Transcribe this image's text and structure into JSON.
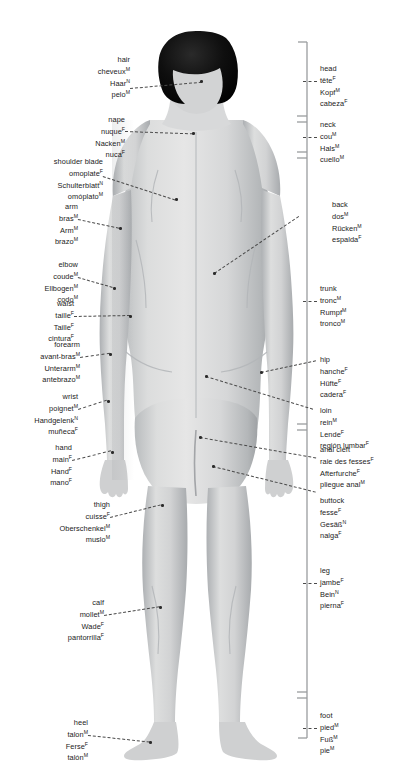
{
  "canvas": {
    "width": 398,
    "height": 778,
    "background": "#ffffff"
  },
  "figure": {
    "skin_color": "#d9dadb",
    "shadow_color": "#a9abad",
    "hair_color": "#0d0d0d",
    "outline_color": "#8d9093"
  },
  "left_labels": [
    {
      "name": "hair",
      "lines": [
        {
          "text": "hair",
          "gender": ""
        },
        {
          "text": "cheveux",
          "gender": "M"
        },
        {
          "text": "Haar",
          "gender": "N"
        },
        {
          "text": "pelo",
          "gender": "M"
        }
      ]
    },
    {
      "name": "nape",
      "lines": [
        {
          "text": "nape",
          "gender": ""
        },
        {
          "text": "nuque",
          "gender": "F"
        },
        {
          "text": "Nacken",
          "gender": "M"
        },
        {
          "text": "nuca",
          "gender": "F"
        }
      ]
    },
    {
      "name": "shoulder-blade",
      "lines": [
        {
          "text": "shoulder blade",
          "gender": ""
        },
        {
          "text": "omoplate",
          "gender": "F"
        },
        {
          "text": "Schulterblatt",
          "gender": "N"
        },
        {
          "text": "omóplato",
          "gender": "M"
        }
      ]
    },
    {
      "name": "arm",
      "lines": [
        {
          "text": "arm",
          "gender": ""
        },
        {
          "text": "bras",
          "gender": "M"
        },
        {
          "text": "Arm",
          "gender": "M"
        },
        {
          "text": "brazo",
          "gender": "M"
        }
      ]
    },
    {
      "name": "elbow",
      "lines": [
        {
          "text": "elbow",
          "gender": ""
        },
        {
          "text": "coude",
          "gender": "M"
        },
        {
          "text": "Ellbogen",
          "gender": "M"
        },
        {
          "text": "codo",
          "gender": "M"
        }
      ]
    },
    {
      "name": "waist",
      "lines": [
        {
          "text": "waist",
          "gender": ""
        },
        {
          "text": "taille",
          "gender": "F"
        },
        {
          "text": "Taille",
          "gender": "F"
        },
        {
          "text": "cintura",
          "gender": "F"
        }
      ]
    },
    {
      "name": "forearm",
      "lines": [
        {
          "text": "forearm",
          "gender": ""
        },
        {
          "text": "avant-bras",
          "gender": "M"
        },
        {
          "text": "Unterarm",
          "gender": "M"
        },
        {
          "text": "antebrazo",
          "gender": "M"
        }
      ]
    },
    {
      "name": "wrist",
      "lines": [
        {
          "text": "wrist",
          "gender": ""
        },
        {
          "text": "poignet",
          "gender": "M"
        },
        {
          "text": "Handgelenk",
          "gender": "N"
        },
        {
          "text": "muñeca",
          "gender": "F"
        }
      ]
    },
    {
      "name": "hand",
      "lines": [
        {
          "text": "hand",
          "gender": ""
        },
        {
          "text": "main",
          "gender": "F"
        },
        {
          "text": "Hand",
          "gender": "F"
        },
        {
          "text": "mano",
          "gender": "F"
        }
      ]
    },
    {
      "name": "thigh",
      "lines": [
        {
          "text": "thigh",
          "gender": ""
        },
        {
          "text": "cuisse",
          "gender": "F"
        },
        {
          "text": "Oberschenkel",
          "gender": "M"
        },
        {
          "text": "muslo",
          "gender": "M"
        }
      ]
    },
    {
      "name": "calf",
      "lines": [
        {
          "text": "calf",
          "gender": ""
        },
        {
          "text": "mollet",
          "gender": "M"
        },
        {
          "text": "Wade",
          "gender": "F"
        },
        {
          "text": "pantorrilla",
          "gender": "F"
        }
      ]
    },
    {
      "name": "heel",
      "lines": [
        {
          "text": "heel",
          "gender": ""
        },
        {
          "text": "talon",
          "gender": "M"
        },
        {
          "text": "Ferse",
          "gender": "F"
        },
        {
          "text": "talón",
          "gender": "M"
        }
      ]
    }
  ],
  "right_labels": [
    {
      "name": "head",
      "lines": [
        {
          "text": "head",
          "gender": ""
        },
        {
          "text": "tête",
          "gender": "F"
        },
        {
          "text": "Kopf",
          "gender": "M"
        },
        {
          "text": "cabeza",
          "gender": "F"
        }
      ]
    },
    {
      "name": "neck",
      "lines": [
        {
          "text": "neck",
          "gender": ""
        },
        {
          "text": "cou",
          "gender": "M"
        },
        {
          "text": "Hals",
          "gender": "M"
        },
        {
          "text": "cuello",
          "gender": "M"
        }
      ]
    },
    {
      "name": "back",
      "lines": [
        {
          "text": "back",
          "gender": ""
        },
        {
          "text": "dos",
          "gender": "M"
        },
        {
          "text": "Rücken",
          "gender": "M"
        },
        {
          "text": "espalda",
          "gender": "F"
        }
      ]
    },
    {
      "name": "trunk",
      "lines": [
        {
          "text": "trunk",
          "gender": ""
        },
        {
          "text": "tronc",
          "gender": "M"
        },
        {
          "text": "Rumpf",
          "gender": "M"
        },
        {
          "text": "tronco",
          "gender": "M"
        }
      ]
    },
    {
      "name": "hip",
      "lines": [
        {
          "text": "hip",
          "gender": ""
        },
        {
          "text": "hanche",
          "gender": "F"
        },
        {
          "text": "Hüfte",
          "gender": "F"
        },
        {
          "text": "cadera",
          "gender": "F"
        }
      ]
    },
    {
      "name": "loin",
      "lines": [
        {
          "text": "loin",
          "gender": ""
        },
        {
          "text": "rein",
          "gender": "M"
        },
        {
          "text": "Lende",
          "gender": "F"
        },
        {
          "text": "región lumbar",
          "gender": "F"
        }
      ]
    },
    {
      "name": "anal-cleft",
      "lines": [
        {
          "text": "anal cleft",
          "gender": ""
        },
        {
          "text": "raie des fesses",
          "gender": "F"
        },
        {
          "text": "Afterfurche",
          "gender": "F"
        },
        {
          "text": "pliegue anal",
          "gender": "M"
        }
      ]
    },
    {
      "name": "buttock",
      "lines": [
        {
          "text": "buttock",
          "gender": ""
        },
        {
          "text": "fesse",
          "gender": "F"
        },
        {
          "text": "Gesäß",
          "gender": "N"
        },
        {
          "text": "nalga",
          "gender": "F"
        }
      ]
    },
    {
      "name": "leg",
      "lines": [
        {
          "text": "leg",
          "gender": ""
        },
        {
          "text": "jambe",
          "gender": "F"
        },
        {
          "text": "Bein",
          "gender": "N"
        },
        {
          "text": "pierna",
          "gender": "F"
        }
      ]
    },
    {
      "name": "foot",
      "lines": [
        {
          "text": "foot",
          "gender": ""
        },
        {
          "text": "pied",
          "gender": "M"
        },
        {
          "text": "Fuß",
          "gender": "M"
        },
        {
          "text": "pie",
          "gender": "M"
        }
      ]
    }
  ],
  "bracket": {
    "color": "#9a9c9e",
    "segments": [
      "head",
      "neck",
      "trunk",
      "buttock-leg",
      "foot"
    ]
  }
}
